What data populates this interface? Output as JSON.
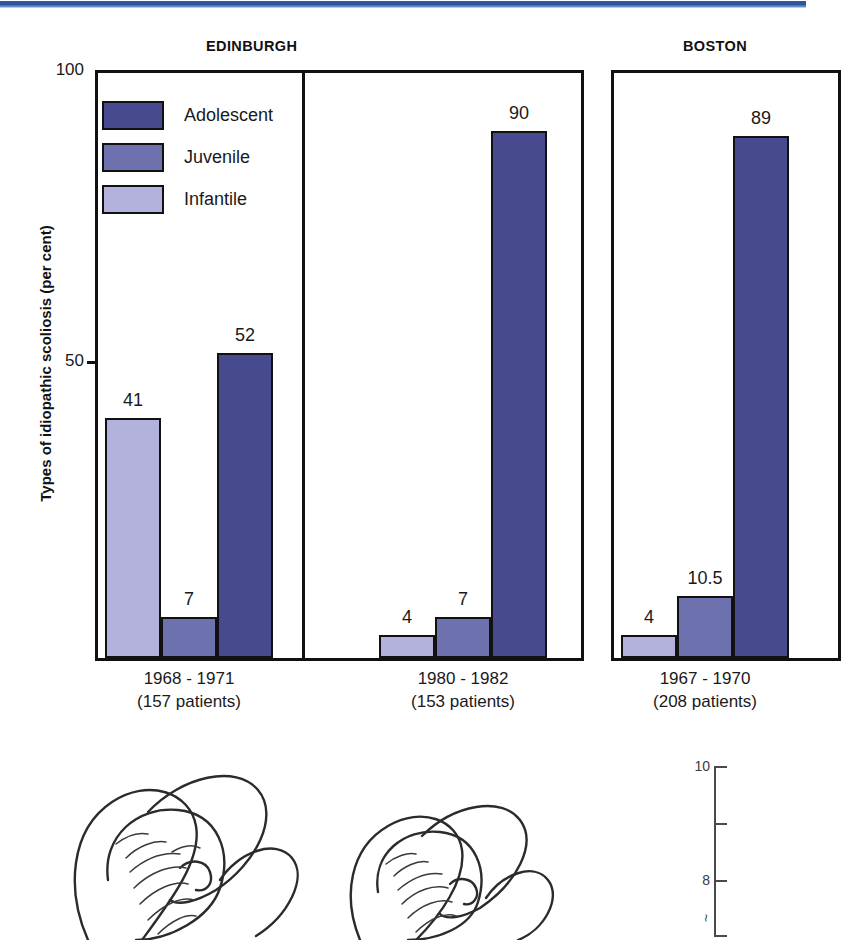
{
  "figure": {
    "y_axis_title": "Types of idiopathic scoliosis (per cent)",
    "regions": [
      {
        "key": "edinburgh",
        "title": "EDINBURGH"
      },
      {
        "key": "boston",
        "title": "BOSTON"
      }
    ],
    "y_ticks": [
      {
        "value": 100,
        "label": "100"
      },
      {
        "value": 50,
        "label": "50"
      }
    ]
  },
  "legend": {
    "items": [
      {
        "label": "Adolescent",
        "color": "#474a8e"
      },
      {
        "label": "Juvenile",
        "color": "#6d71ae"
      },
      {
        "label": "Infantile",
        "color": "#b3b2dd"
      }
    ]
  },
  "chart_data": {
    "type": "bar",
    "title": "Types of idiopathic scoliosis (per cent)",
    "xlabel": "",
    "ylabel": "Types of idiopathic scoliosis (per cent)",
    "ylim": [
      0,
      100
    ],
    "yticks": [
      50,
      100
    ],
    "grid": false,
    "legend_position": "inside-top-left",
    "series": [
      {
        "name": "Infantile",
        "color": "#b3b2dd",
        "values": [
          41,
          4,
          4
        ]
      },
      {
        "name": "Juvenile",
        "color": "#6d71ae",
        "values": [
          7,
          7,
          10.5
        ]
      },
      {
        "name": "Adolescent",
        "color": "#474a8e",
        "values": [
          52,
          90,
          89
        ]
      }
    ],
    "categories": [
      "1968 - 1971",
      "1980 - 1982",
      "1967 - 1970"
    ],
    "groups": [
      {
        "region": "EDINBURGH",
        "period": "1968 - 1971",
        "patients_label": "(157 patients)",
        "patients": 157,
        "bars": [
          {
            "series": "Infantile",
            "value": 41,
            "label": "41"
          },
          {
            "series": "Juvenile",
            "value": 7,
            "label": "7"
          },
          {
            "series": "Adolescent",
            "value": 52,
            "label": "52"
          }
        ]
      },
      {
        "region": "EDINBURGH",
        "period": "1980 - 1982",
        "patients_label": "(153 patients)",
        "patients": 153,
        "bars": [
          {
            "series": "Infantile",
            "value": 4,
            "label": "4"
          },
          {
            "series": "Juvenile",
            "value": 7,
            "label": "7"
          },
          {
            "series": "Adolescent",
            "value": 90,
            "label": "90"
          }
        ]
      },
      {
        "region": "BOSTON",
        "period": "1967 - 1970",
        "patients_label": "(208 patients)",
        "patients": 208,
        "bars": [
          {
            "series": "Infantile",
            "value": 4,
            "label": "4"
          },
          {
            "series": "Juvenile",
            "value": 10.5,
            "label": "10.5"
          },
          {
            "series": "Adolescent",
            "value": 89,
            "label": "89"
          }
        ]
      }
    ]
  },
  "mini_axis": {
    "ticks": [
      {
        "value": 10,
        "label": "10"
      },
      {
        "value": 9,
        "label": ""
      },
      {
        "value": 8,
        "label": "8"
      },
      {
        "value": 7,
        "label": ""
      }
    ],
    "caption": "~"
  },
  "colors": {
    "top_rule": "#2a539a",
    "adolescent": "#474a8e",
    "juvenile": "#6d71ae",
    "infantile": "#b3b2dd",
    "ink": "#111111"
  }
}
